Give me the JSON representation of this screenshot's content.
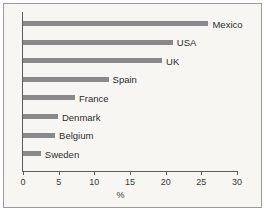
{
  "chart_data": {
    "type": "bar",
    "orientation": "horizontal",
    "title": "",
    "xlabel": "%",
    "ylabel": "",
    "xlim": [
      0,
      30
    ],
    "xticks": [
      0,
      5,
      10,
      15,
      20,
      25,
      30
    ],
    "xtick_labels": [
      "0",
      "5",
      "10",
      "15",
      "20",
      "25",
      "30"
    ],
    "grid": false,
    "legend": false,
    "bar_color": "#8a8a8a",
    "background_color": "#f7f6f2",
    "categories": [
      "Mexico",
      "USA",
      "UK",
      "Spain",
      "France",
      "Denmark",
      "Belgium",
      "Sweden"
    ],
    "values": [
      26,
      21,
      19.5,
      12,
      7.3,
      4.9,
      4.5,
      2.5
    ],
    "bars": [
      {
        "label": "Mexico",
        "value": 26
      },
      {
        "label": "USA",
        "value": 21
      },
      {
        "label": "UK",
        "value": 19.5
      },
      {
        "label": "Spain",
        "value": 12
      },
      {
        "label": "France",
        "value": 7.3
      },
      {
        "label": "Denmark",
        "value": 4.9
      },
      {
        "label": "Belgium",
        "value": 4.5
      },
      {
        "label": "Sweden",
        "value": 2.5
      }
    ]
  }
}
